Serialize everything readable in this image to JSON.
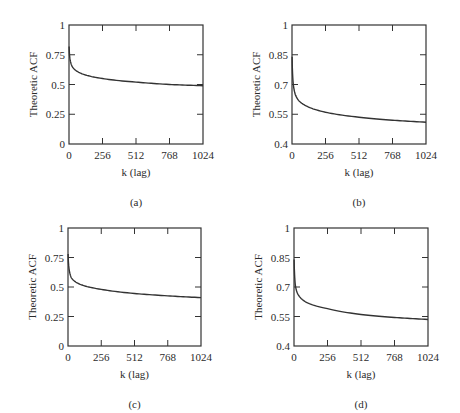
{
  "figure": {
    "panels": [
      {
        "id": "a",
        "caption": "(a)"
      },
      {
        "id": "b",
        "caption": "(b)"
      },
      {
        "id": "c",
        "caption": "(c)"
      },
      {
        "id": "d",
        "caption": "(d)"
      }
    ]
  },
  "chart_data": [
    {
      "type": "line",
      "panel": "(a)",
      "title": "",
      "xlabel": "k (lag)",
      "ylabel": "Theoretic ACF",
      "xlim": [
        0,
        1024
      ],
      "ylim": [
        0,
        1
      ],
      "x_ticks": [
        "0",
        "256",
        "512",
        "768",
        "1024"
      ],
      "y_ticks": [
        "0",
        "0.25",
        "0.5",
        "0.75",
        "1"
      ],
      "grid": false,
      "legend": null,
      "series": [
        {
          "name": "ACF",
          "x": [
            1,
            4,
            10,
            25,
            50,
            100,
            256,
            512,
            768,
            1024
          ],
          "values": [
            0.82,
            0.75,
            0.7,
            0.65,
            0.62,
            0.59,
            0.55,
            0.52,
            0.5,
            0.49
          ]
        }
      ]
    },
    {
      "type": "line",
      "panel": "(b)",
      "title": "",
      "xlabel": "k (lag)",
      "ylabel": "Theoretic ACF",
      "xlim": [
        0,
        1024
      ],
      "ylim": [
        0.4,
        1
      ],
      "x_ticks": [
        "0",
        "256",
        "512",
        "768",
        "1024"
      ],
      "y_ticks": [
        "0.4",
        "0.55",
        "0.7",
        "0.85",
        "1"
      ],
      "grid": false,
      "legend": null,
      "series": [
        {
          "name": "ACF",
          "x": [
            1,
            4,
            10,
            25,
            50,
            100,
            256,
            512,
            768,
            1024
          ],
          "values": [
            0.84,
            0.76,
            0.7,
            0.65,
            0.62,
            0.595,
            0.56,
            0.535,
            0.52,
            0.51
          ]
        }
      ]
    },
    {
      "type": "line",
      "panel": "(c)",
      "title": "",
      "xlabel": "k (lag)",
      "ylabel": "Theoretic ACF",
      "xlim": [
        0,
        1024
      ],
      "ylim": [
        0,
        1
      ],
      "x_ticks": [
        "0",
        "256",
        "512",
        "768",
        "1024"
      ],
      "y_ticks": [
        "0",
        "0.25",
        "0.5",
        "0.75",
        "1"
      ],
      "grid": false,
      "legend": null,
      "series": [
        {
          "name": "ACF",
          "x": [
            1,
            4,
            10,
            25,
            50,
            100,
            256,
            512,
            768,
            1024
          ],
          "values": [
            0.78,
            0.7,
            0.64,
            0.58,
            0.55,
            0.52,
            0.48,
            0.445,
            0.425,
            0.41
          ]
        }
      ]
    },
    {
      "type": "line",
      "panel": "(d)",
      "title": "",
      "xlabel": "k (lag)",
      "ylabel": "Theoretic ACF",
      "xlim": [
        0,
        1024
      ],
      "ylim": [
        0.4,
        1
      ],
      "x_ticks": [
        "0",
        "256",
        "512",
        "768",
        "1024"
      ],
      "y_ticks": [
        "0.4",
        "0.55",
        "0.7",
        "0.85",
        "1"
      ],
      "grid": false,
      "legend": null,
      "series": [
        {
          "name": "ACF",
          "x": [
            1,
            4,
            10,
            25,
            50,
            100,
            256,
            512,
            768,
            1024
          ],
          "values": [
            0.84,
            0.77,
            0.71,
            0.67,
            0.645,
            0.62,
            0.59,
            0.56,
            0.545,
            0.535
          ]
        }
      ]
    }
  ],
  "layout": {
    "frames": [
      {
        "left": 69,
        "top": 25,
        "right": 203,
        "bottom": 144
      },
      {
        "left": 292,
        "top": 25,
        "right": 426,
        "bottom": 144
      },
      {
        "left": 68,
        "top": 228,
        "right": 201,
        "bottom": 346
      },
      {
        "left": 294,
        "top": 228,
        "right": 428,
        "bottom": 346
      }
    ],
    "line_color": "#333333"
  }
}
